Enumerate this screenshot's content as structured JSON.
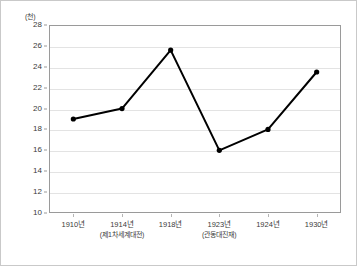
{
  "chart_data": {
    "type": "line",
    "title": "",
    "xlabel": "",
    "ylabel": "",
    "unit_label": "(천)",
    "categories": [
      "1910년",
      "1914년",
      "1918년",
      "1923년",
      "1924년",
      "1930년"
    ],
    "category_notes": [
      "",
      "(제1차세계대전)",
      "",
      "(관동대진재)",
      "",
      ""
    ],
    "values": [
      19.0,
      20.0,
      25.6,
      16.0,
      18.0,
      23.5
    ],
    "ylim": [
      10,
      28
    ],
    "ytick_step": 2,
    "yticks": [
      10,
      12,
      14,
      16,
      18,
      20,
      22,
      24,
      26,
      28
    ],
    "ytick_labels": [
      "10",
      "12",
      "14",
      "16",
      "18",
      "20",
      "22",
      "24",
      "26",
      "28"
    ],
    "grid": true,
    "grid_axis": "y",
    "legend": false,
    "legend_position": "none",
    "marker": "filled-circle",
    "line_color": "#000000",
    "marker_color": "#000000",
    "grid_color": "#e3e3e3",
    "axis_color": "#9a9a9a",
    "background_color": "#ffffff"
  }
}
